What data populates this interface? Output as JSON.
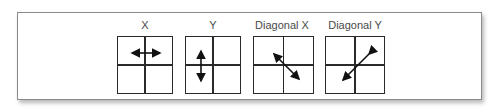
{
  "figure": {
    "panels": [
      {
        "label": "X",
        "arrow": "horizontal-double-arrow"
      },
      {
        "label": "Y",
        "arrow": "vertical-double-arrow"
      },
      {
        "label": "Diagonal X",
        "arrow": "diagonal-nw-se-double-arrow"
      },
      {
        "label": "Diagonal Y",
        "arrow": "diagonal-ne-sw-double-arrow"
      }
    ],
    "colors": {
      "border": "#8a8a8a",
      "grid_line": "#2a2a2a",
      "arrow": "#111111",
      "label_text": "#4a4a4a"
    }
  }
}
